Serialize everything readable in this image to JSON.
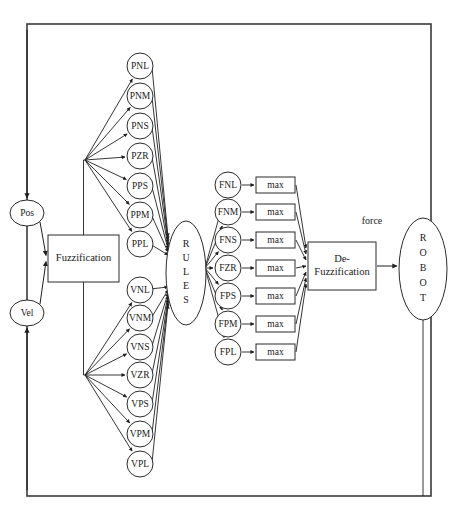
{
  "figure": {
    "corner_note": ""
  },
  "frame": {
    "label": "feedback-loop-frame",
    "x": 27,
    "y": 24,
    "width": 404,
    "height": 472
  },
  "inputs": [
    {
      "id": "pos",
      "label": "Pos",
      "cx": 27,
      "cy": 213,
      "rx": 17,
      "ry": 13
    },
    {
      "id": "vel",
      "label": "Vel",
      "cx": 27,
      "cy": 313,
      "rx": 17,
      "ry": 13
    }
  ],
  "blocks": [
    {
      "id": "fuzzification",
      "lines": [
        "Fuzzification"
      ],
      "x": 48,
      "y": 235,
      "width": 71,
      "height": 47
    },
    {
      "id": "defuzzification",
      "lines": [
        "De-",
        "Fuzzification"
      ],
      "x": 308,
      "y": 242,
      "width": 68,
      "height": 48
    }
  ],
  "rules": {
    "id": "rules",
    "label": "RULES",
    "letters": [
      "R",
      "U",
      "L",
      "E",
      "S"
    ],
    "cx": 186,
    "cy": 273,
    "rx": 20,
    "ry": 52
  },
  "robot": {
    "id": "robot",
    "label": "ROBOT",
    "letters": [
      "R",
      "O",
      "B",
      "O",
      "T"
    ],
    "cx": 423,
    "cy": 269,
    "rx": 24,
    "ry": 51
  },
  "position_sets": {
    "group_label": "position-fuzzy-sets",
    "cx": 140,
    "radius": 13,
    "nodes": [
      {
        "label": "PNL",
        "cy": 66
      },
      {
        "label": "PNM",
        "cy": 96
      },
      {
        "label": "PNS",
        "cy": 126
      },
      {
        "label": "PZR",
        "cy": 156
      },
      {
        "label": "PPS",
        "cy": 186
      },
      {
        "label": "PPM",
        "cy": 215
      },
      {
        "label": "PPL",
        "cy": 244
      }
    ]
  },
  "velocity_sets": {
    "group_label": "velocity-fuzzy-sets",
    "cx": 140,
    "radius": 13,
    "nodes": [
      {
        "label": "VNL",
        "cy": 290
      },
      {
        "label": "VNM",
        "cy": 318
      },
      {
        "label": "VNS",
        "cy": 347
      },
      {
        "label": "VZR",
        "cy": 375
      },
      {
        "label": "VPS",
        "cy": 404
      },
      {
        "label": "VPM",
        "cy": 434
      },
      {
        "label": "VPL",
        "cy": 464
      }
    ]
  },
  "force_sets": {
    "group_label": "force-fuzzy-sets",
    "cx": 228,
    "radius": 13,
    "nodes": [
      {
        "label": "FNL",
        "cy": 185
      },
      {
        "label": "FNM",
        "cy": 212
      },
      {
        "label": "FNS",
        "cy": 240
      },
      {
        "label": "FZR",
        "cy": 268
      },
      {
        "label": "FPS",
        "cy": 296
      },
      {
        "label": "FPM",
        "cy": 324
      },
      {
        "label": "FPL",
        "cy": 352
      }
    ]
  },
  "max_blocks": {
    "group_label": "max-operator-blocks",
    "x": 256,
    "width": 39,
    "height": 16,
    "label": "max",
    "rows": [
      {
        "cy": 185
      },
      {
        "cy": 212
      },
      {
        "cy": 240
      },
      {
        "cy": 268
      },
      {
        "cy": 296
      },
      {
        "cy": 324
      },
      {
        "cy": 352
      }
    ]
  },
  "edge_labels": [
    {
      "id": "force-label",
      "text": "force",
      "x": 372,
      "y": 222
    }
  ],
  "fan_origins": {
    "position_fan": {
      "x": 85,
      "y": 160
    },
    "velocity_fan": {
      "x": 85,
      "y": 375
    },
    "rules_to_force_fan": {
      "x": 205,
      "y": 268
    },
    "max_to_defuzz_fan": {
      "x": 306,
      "y": 268
    }
  },
  "colors": {
    "stroke": "#1f1f1f",
    "frame": "#3a3a3a",
    "shape_fill": "#ffffff",
    "text": "#1a1a1a",
    "background": "#ffffff"
  }
}
